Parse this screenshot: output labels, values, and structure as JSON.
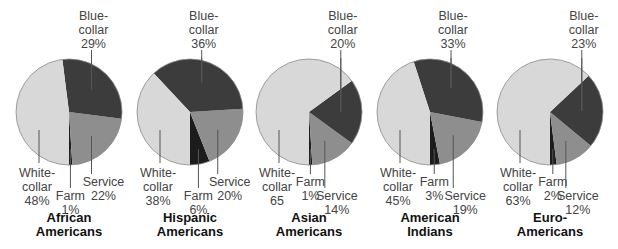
{
  "colors": {
    "white_collar": "#d8d8d8",
    "blue_collar": "#3c3c3c",
    "service": "#8e8e8e",
    "farm": "#1c1c1c",
    "outline": "#8a8a8a",
    "leader": "#555555"
  },
  "chart_data": {
    "type": "pie",
    "title": "",
    "categories": [
      "Farm",
      "Service",
      "Blue-collar",
      "White-collar"
    ],
    "charts": [
      {
        "group": "African Americans",
        "title_lines": [
          "African",
          "Americans"
        ],
        "values": {
          "farm": 1,
          "service": 22,
          "blue_collar": 29,
          "white_collar": 48
        },
        "labels": {
          "blue_collar": [
            "Blue-",
            "collar",
            "29%"
          ],
          "white_collar": [
            "White-",
            "collar",
            "48%"
          ],
          "farm": [
            "Farm",
            "1%"
          ],
          "service": [
            "Service",
            "22%"
          ]
        }
      },
      {
        "group": "Hispanic Americans",
        "title_lines": [
          "Hispanic",
          "Americans"
        ],
        "values": {
          "farm": 6,
          "service": 20,
          "blue_collar": 36,
          "white_collar": 38
        },
        "labels": {
          "blue_collar": [
            "Blue-",
            "collar",
            "36%"
          ],
          "white_collar": [
            "White-",
            "collar",
            "38%"
          ],
          "farm": [
            "Farm",
            "6%"
          ],
          "service": [
            "Service",
            "20%"
          ]
        }
      },
      {
        "group": "Asian Americans",
        "title_lines": [
          "Asian",
          "Americans"
        ],
        "values": {
          "farm": 1,
          "service": 14,
          "blue_collar": 20,
          "white_collar": 65
        },
        "labels": {
          "blue_collar": [
            "Blue-",
            "collar",
            "20%"
          ],
          "white_collar": [
            "White-",
            "collar",
            "65"
          ],
          "farm": [
            "Farm",
            "1%"
          ],
          "service": [
            "Service",
            "14%"
          ]
        }
      },
      {
        "group": "American Indians",
        "title_lines": [
          "American",
          "Indians"
        ],
        "values": {
          "farm": 3,
          "service": 19,
          "blue_collar": 33,
          "white_collar": 45
        },
        "labels": {
          "blue_collar": [
            "Blue-",
            "collar",
            "33%"
          ],
          "white_collar": [
            "White-",
            "collar",
            "45%"
          ],
          "farm": [
            "Farm",
            "3%"
          ],
          "service": [
            "Service",
            "19%"
          ]
        }
      },
      {
        "group": "Euro-Americans",
        "title_lines": [
          "Euro-",
          "Americans"
        ],
        "values": {
          "farm": 2,
          "service": 12,
          "blue_collar": 23,
          "white_collar": 63
        },
        "labels": {
          "blue_collar": [
            "Blue-",
            "collar",
            "23%"
          ],
          "white_collar": [
            "White-",
            "collar",
            "63%"
          ],
          "farm": [
            "Farm",
            "2%"
          ],
          "service": [
            "Service",
            "12%"
          ]
        }
      }
    ]
  },
  "layout": {
    "centers_x": [
      69,
      190,
      309,
      430,
      550
    ],
    "center_y": 112,
    "radius": 53,
    "farm_label_lowered": [
      true,
      true,
      false,
      false,
      false
    ],
    "service_label_lowered": [
      false,
      false,
      true,
      true,
      true
    ]
  }
}
